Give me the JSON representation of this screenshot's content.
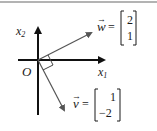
{
  "diagram": {
    "origin_label": "O",
    "x_axis_label": "x",
    "x_axis_subscript": "1",
    "y_axis_label": "x",
    "y_axis_subscript": "2",
    "vectors": [
      {
        "name": "w",
        "arrow_glyph": "→",
        "equals": "=",
        "components": [
          "2",
          "1"
        ]
      },
      {
        "name": "v",
        "arrow_glyph": "→",
        "equals": "=",
        "components": [
          "1",
          "−2"
        ]
      }
    ],
    "annotations": [
      "right-angle-marker between w and v"
    ]
  },
  "colors": {
    "axis": "#111111",
    "vector": "#555555",
    "text": "#1a1a1a",
    "border": "#9a9a9a",
    "background": "#ffffff"
  }
}
